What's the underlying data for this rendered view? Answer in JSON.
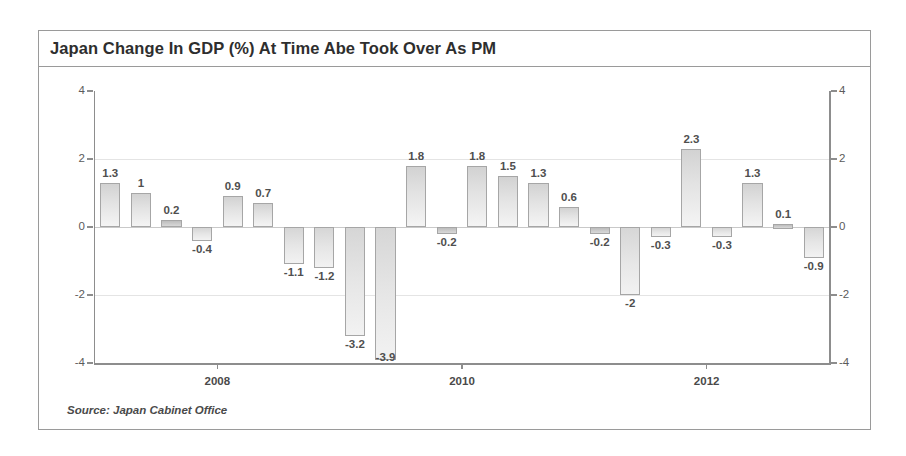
{
  "chart": {
    "title": "Japan Change In GDP (%) At Time Abe Took Over As PM",
    "source": "Source: Japan Cabinet Office"
  },
  "chart_data": {
    "type": "bar",
    "title": "Japan Change In GDP (%) At Time Abe Took Over As PM",
    "xlabel": "",
    "ylabel": "",
    "ylim": [
      -4,
      4
    ],
    "yticks": [
      4,
      2,
      0,
      -2,
      -4
    ],
    "ytick_labels": [
      "4",
      "2",
      "0",
      "-2",
      "-4"
    ],
    "grid": true,
    "legend": null,
    "x_axis_ticks": [
      {
        "label": "2008",
        "index": 4
      },
      {
        "label": "2010",
        "index": 12
      },
      {
        "label": "2012",
        "index": 20
      }
    ],
    "categories": [
      "Q1-1",
      "Q1-2",
      "Q1-3",
      "Q1-4",
      "Q2-1",
      "Q2-2",
      "Q2-3",
      "Q2-4",
      "Q3-1",
      "Q3-2",
      "Q3-3",
      "Q3-4",
      "Q4-1",
      "Q4-2",
      "Q4-3",
      "Q4-4",
      "Q5-1",
      "Q5-2",
      "Q5-3",
      "Q5-4",
      "Q6-1",
      "Q6-2",
      "Q6-3",
      "Q6-4"
    ],
    "values": [
      1.3,
      1,
      0.2,
      -0.4,
      0.9,
      0.7,
      -1.1,
      -1.2,
      -3.2,
      -3.9,
      1.8,
      -0.2,
      1.8,
      1.5,
      1.3,
      0.6,
      -0.2,
      -2,
      -0.3,
      2.3,
      -0.3,
      1.3,
      0.1,
      -0.9
    ],
    "data_labels": [
      "1.3",
      "1",
      "0.2",
      "-0.4",
      "0.9",
      "0.7",
      "-1.1",
      "-1.2",
      "-3.2",
      "-3.9",
      "1.8",
      "-0.2",
      "1.8",
      "1.5",
      "1.3",
      "0.6",
      "-0.2",
      "-2",
      "-0.3",
      "2.3",
      "-0.3",
      "1.3",
      "0.1",
      "-0.9"
    ],
    "source": "Source: Japan Cabinet Office",
    "bar_color": "#e0e0e0",
    "bar_border_color": "#a6a6a6",
    "axis_color": "#8d8d8d",
    "grid_color": "#e4e4e4"
  }
}
